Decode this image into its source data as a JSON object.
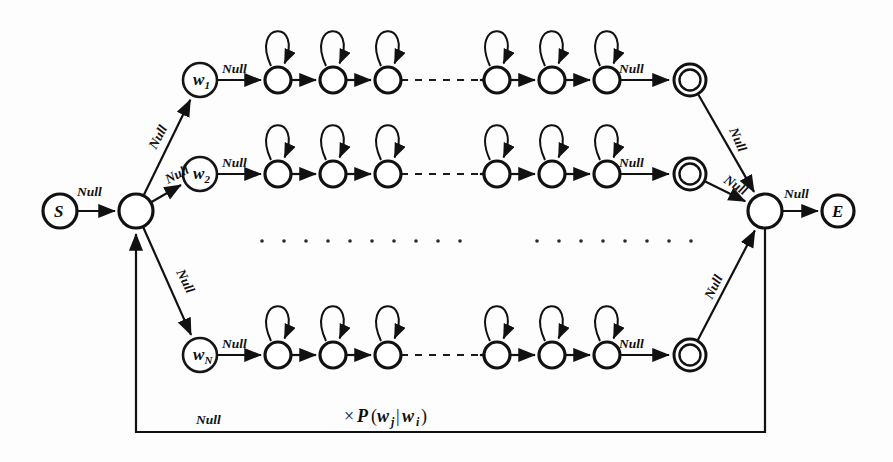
{
  "figure": {
    "kind": "finite-state-network-diagram",
    "background_color": "#fdfdfd",
    "ink_color": "#111111"
  },
  "labels": {
    "null": "Null",
    "start_node": "S",
    "end_node": "E",
    "prob_times": "×",
    "prob_fn": "P",
    "prob_open": "(",
    "prob_w": "w",
    "prob_sub_j": "j",
    "prob_bar": "|",
    "prob_sub_i": "i",
    "prob_close": ")",
    "prob_full": "×P(wⱼ|wᵢ)"
  },
  "nodes": {
    "start": {
      "id": "S",
      "label": "S",
      "x": 60,
      "y": 211,
      "r": 17,
      "type": "labeled-double-ring"
    },
    "entry_hub": {
      "id": "entry-hub",
      "label": "",
      "x": 136,
      "y": 211,
      "r": 17,
      "type": "plain"
    },
    "exit_hub": {
      "id": "exit-hub",
      "label": "",
      "x": 765,
      "y": 211,
      "r": 17,
      "type": "plain"
    },
    "end": {
      "id": "E",
      "label": "E",
      "x": 838,
      "y": 211,
      "r": 16,
      "type": "labeled-ring"
    }
  },
  "word_rows": [
    {
      "id": "row-w1",
      "word_label": "w",
      "word_sub": "1",
      "word_x": 200,
      "y": 80,
      "entry_label": "Null",
      "exit_label": "Null",
      "states_left_x": [
        278,
        333,
        388
      ],
      "states_right_x": [
        497,
        552,
        607
      ],
      "accept_x": 690,
      "state_r": 13
    },
    {
      "id": "row-w2",
      "word_label": "w",
      "word_sub": "2",
      "word_x": 200,
      "y": 174,
      "entry_label": "Null",
      "exit_label": "Null",
      "states_left_x": [
        278,
        333,
        388
      ],
      "states_right_x": [
        497,
        552,
        607
      ],
      "accept_x": 690,
      "state_r": 13
    },
    {
      "id": "row-wN",
      "word_label": "w",
      "word_sub": "N",
      "word_x": 200,
      "y": 355,
      "entry_label": "Null",
      "exit_label": "Null",
      "states_left_x": [
        278,
        333,
        388
      ],
      "states_right_x": [
        497,
        552,
        607
      ],
      "accept_x": 690,
      "state_r": 13
    }
  ],
  "branch_edges": [
    {
      "id": "hub-to-w1",
      "label": "Null",
      "label_x": 156,
      "label_y": 150,
      "label_rot": -62
    },
    {
      "id": "hub-to-w2",
      "label": "Null",
      "label_x": 168,
      "label_y": 184,
      "label_rot": -28
    },
    {
      "id": "hub-to-wN",
      "label": "Null",
      "label_x": 176,
      "label_y": 272,
      "label_rot": 63
    }
  ],
  "merge_edges": [
    {
      "id": "w1-accept-to-exit",
      "label": "Null",
      "label_x": 729,
      "label_y": 130,
      "label_rot": 66
    },
    {
      "id": "w2-accept-to-exit",
      "label": "Null",
      "label_x": 723,
      "label_y": 182,
      "label_rot": 33
    },
    {
      "id": "wN-accept-to-exit",
      "label": "Null",
      "label_x": 712,
      "label_y": 300,
      "label_rot": -64
    }
  ],
  "terminal_edges": [
    {
      "id": "start-to-hub",
      "label": "Null",
      "label_x": 77,
      "label_y": 196
    },
    {
      "id": "exit-to-end",
      "label": "Null",
      "label_x": 784,
      "label_y": 198
    }
  ],
  "feedback_edge": {
    "id": "bigram-feedback",
    "left_x": 136,
    "right_x": 765,
    "bottom_y": 432,
    "null_label": "Null",
    "null_label_x": 196,
    "null_label_y": 424,
    "prob_label_x": 344,
    "prob_label_y": 422
  },
  "ellipsis_rows": [
    {
      "id": "ellipsis-left",
      "y": 241,
      "start_x": 262,
      "count": 10,
      "gap": 22,
      "dot_r": 1.8
    },
    {
      "id": "ellipsis-right",
      "y": 241,
      "start_x": 537,
      "count": 8,
      "gap": 22,
      "dot_r": 1.8
    }
  ],
  "row_dashed_gap": {
    "from_x": 401,
    "to_x": 484
  }
}
